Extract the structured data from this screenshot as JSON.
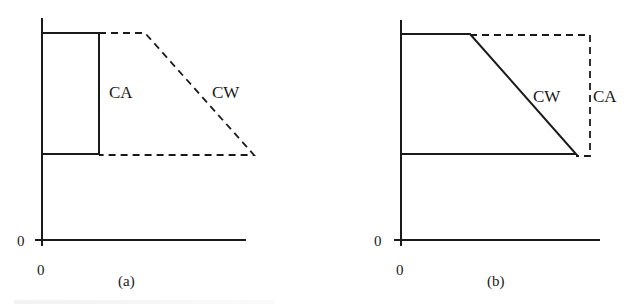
{
  "figure": {
    "panels": [
      {
        "id": "a",
        "sublabel": "(a)",
        "origin_x_label": "0",
        "origin_y_label": "0",
        "curves": [
          {
            "name": "CA",
            "label": "CA",
            "style": "solid",
            "shape": "rectangle"
          },
          {
            "name": "CW",
            "label": "CW",
            "style": "dashed",
            "shape": "trapezoid"
          }
        ]
      },
      {
        "id": "b",
        "sublabel": "(b)",
        "origin_x_label": "0",
        "origin_y_label": "0",
        "curves": [
          {
            "name": "CW",
            "label": "CW",
            "style": "solid",
            "shape": "trapezoid"
          },
          {
            "name": "CA",
            "label": "CA",
            "style": "dashed",
            "shape": "rectangle"
          }
        ]
      }
    ],
    "colors": {
      "ink": "#1a1a1a",
      "background": "#ffffff"
    }
  }
}
